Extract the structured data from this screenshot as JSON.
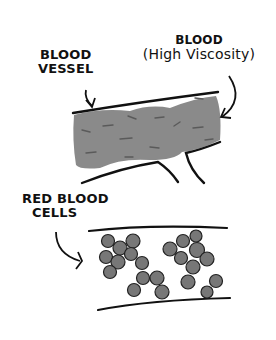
{
  "labels": {
    "blood_vessel": [
      "BLOOD",
      "VESSEL"
    ],
    "blood": "BLOOD",
    "blood_sub": "(High Viscosity)",
    "red_blood_cells": [
      "RED BLOOD",
      "CELLS"
    ]
  },
  "colors": {
    "ink": "#111111",
    "blood_fill": "#8a8a8a",
    "blood_streak": "#5a5a5a",
    "cell_fill": "#777777",
    "background": "#ffffff"
  },
  "panels": [
    {
      "name": "high-viscosity-vessel",
      "description": "Blood vessel filled with thick grey blood"
    },
    {
      "name": "clumped-red-blood-cells",
      "description": "Vessel with clustered red blood cells"
    }
  ]
}
